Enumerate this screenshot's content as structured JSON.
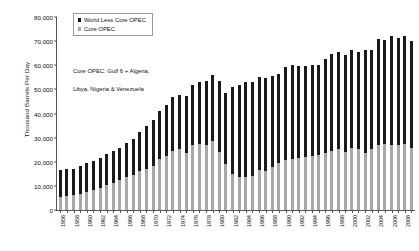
{
  "chart_data": {
    "type": "bar",
    "stacked": true,
    "title": "",
    "subtitle": "",
    "xlabel": "",
    "ylabel": "Thousand Barrels Per Day",
    "ylim": [
      0,
      80000
    ],
    "ytick_values": [
      80000,
      70000,
      60000,
      50000,
      40000,
      30000,
      20000,
      10000,
      0
    ],
    "ytick_labels": [
      "80,000",
      "70,000",
      "60,000",
      "50,000",
      "40,000",
      "30,000",
      "20,000",
      "10,000",
      "0"
    ],
    "grid": false,
    "legend_position": "top-left",
    "annotation": "Core OPEC: Gulf 6 + Algeria,\nLibya, Nigeria & Venezuela",
    "x": [
      1956,
      1957,
      1958,
      1959,
      1960,
      1961,
      1962,
      1963,
      1964,
      1965,
      1966,
      1967,
      1968,
      1969,
      1970,
      1971,
      1972,
      1973,
      1974,
      1975,
      1976,
      1977,
      1978,
      1979,
      1980,
      1981,
      1982,
      1983,
      1984,
      1985,
      1986,
      1987,
      1988,
      1989,
      1990,
      1991,
      1992,
      1993,
      1994,
      1995,
      1996,
      1997,
      1998,
      1999,
      2000,
      2001,
      2002,
      2003,
      2004,
      2005,
      2006,
      2007,
      2008,
      2009
    ],
    "xtick_labels": [
      "1956",
      "",
      "1958",
      "",
      "1960",
      "",
      "1962",
      "",
      "1964",
      "",
      "1966",
      "",
      "1968",
      "",
      "1970",
      "",
      "1972",
      "",
      "1974",
      "",
      "1976",
      "",
      "1978",
      "",
      "1980",
      "",
      "1982",
      "",
      "1984",
      "",
      "1986",
      "",
      "1988",
      "",
      "1990",
      "",
      "1992",
      "",
      "1994",
      "",
      "1996",
      "",
      "1998",
      "",
      "2000",
      "",
      "2002",
      "",
      "2004",
      "",
      "2006",
      "",
      "2008",
      ""
    ],
    "series": [
      {
        "name": "Core OPEC",
        "color": "#a8a8a8",
        "values": [
          5500,
          6000,
          6100,
          6800,
          7600,
          8300,
          9300,
          10200,
          11400,
          12300,
          13500,
          14400,
          16000,
          17000,
          18300,
          21000,
          22300,
          24600,
          25300,
          23500,
          26900,
          27500,
          27000,
          28700,
          24200,
          19200,
          14800,
          13600,
          13600,
          14300,
          16400,
          16200,
          17800,
          19300,
          20600,
          21100,
          21600,
          21900,
          22300,
          22600,
          23500,
          24500,
          25100,
          24200,
          25500,
          25100,
          23600,
          25400,
          26800,
          27300,
          27100,
          26800,
          27400,
          25600
        ]
      },
      {
        "name": "World Less Core OPEC",
        "color": "#1a1a1a",
        "values": [
          11000,
          11200,
          11100,
          11300,
          11900,
          12100,
          12400,
          13000,
          13200,
          13600,
          14200,
          15100,
          16200,
          17800,
          19100,
          20200,
          21400,
          22100,
          22500,
          23800,
          24900,
          25700,
          26500,
          27300,
          29400,
          29400,
          36300,
          38300,
          39400,
          38600,
          38600,
          38400,
          37600,
          37000,
          38500,
          38900,
          38200,
          37800,
          38000,
          37700,
          39100,
          40000,
          40400,
          40000,
          40700,
          40200,
          42600,
          41000,
          44000,
          43200,
          45000,
          44500,
          44800,
          44300
        ]
      }
    ]
  },
  "legend": {
    "items": [
      {
        "label": "World Less Core OPEC",
        "color": "#1a1a1a"
      },
      {
        "label": "Core OPEC",
        "color": "#a8a8a8"
      }
    ]
  },
  "axis": {
    "y_title": "Thousand Barrels Per Day"
  },
  "annotation": {
    "line1": "Core OPEC: Gulf 6 + Algeria,",
    "line2": "Libya, Nigeria & Venezuela"
  }
}
